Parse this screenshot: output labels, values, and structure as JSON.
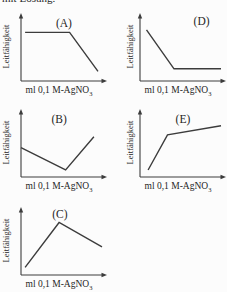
{
  "page": {
    "background": "#fcfcfc",
    "text_color": "#262626",
    "line_color": "#3c3c3c",
    "clipped_top_text": "mit Lösung."
  },
  "axis": {
    "xlabel_main": "ml 0,1 M-AgNO",
    "xlabel_sub": "3",
    "ylabel": "Leitfähigkeit"
  },
  "chart_data": [
    {
      "id": "A",
      "type": "line",
      "title": "(A)",
      "xlabel": "ml 0,1 M-AgNO3",
      "ylabel": "Leitfähigkeit",
      "axis_style": "qualitative axes with arrowheads, no ticks, no numeric scale, no grid",
      "description": "Conductivity stays constant at a high level, then decreases linearly to a low value",
      "points": [
        [
          0.05,
          0.76
        ],
        [
          0.6,
          0.76
        ],
        [
          0.95,
          0.15
        ]
      ],
      "title_x": 0.53,
      "title_y": 16
    },
    {
      "id": "B",
      "type": "line",
      "title": "(B)",
      "xlabel": "ml 0,1 M-AgNO3",
      "ylabel": "Leitfähigkeit",
      "axis_style": "qualitative axes with arrowheads, no ticks, no numeric scale, no grid",
      "description": "Conductivity decreases to a minimum, then rises again above the starting value",
      "points": [
        [
          0.0,
          0.46
        ],
        [
          0.55,
          0.11
        ],
        [
          0.9,
          0.63
        ]
      ],
      "title_x": 0.47,
      "title_y": 16
    },
    {
      "id": "C",
      "type": "line",
      "title": "(C)",
      "xlabel": "ml 0,1 M-AgNO3",
      "ylabel": "Leitfähigkeit",
      "axis_style": "qualitative axes with arrowheads, no ticks, no numeric scale, no grid",
      "description": "Conductivity rises to a maximum, then decreases moderately",
      "points": [
        [
          0.05,
          0.12
        ],
        [
          0.47,
          0.82
        ],
        [
          1.0,
          0.44
        ]
      ],
      "title_x": 0.48,
      "title_y": 13
    },
    {
      "id": "D",
      "type": "line",
      "title": "(D)",
      "xlabel": "ml 0,1 M-AgNO3",
      "ylabel": "Leitfähigkeit",
      "axis_style": "qualitative axes with arrowheads, no ticks, no numeric scale, no grid",
      "description": "Conductivity decreases steeply, then stays constant at a low level",
      "points": [
        [
          0.08,
          0.8
        ],
        [
          0.42,
          0.19
        ],
        [
          1.0,
          0.19
        ]
      ],
      "title_x": 0.76,
      "title_y": 14
    },
    {
      "id": "E",
      "type": "line",
      "title": "(E)",
      "xlabel": "ml 0,1 M-AgNO3",
      "ylabel": "Leitfähigkeit",
      "axis_style": "qualitative axes with arrowheads, no ticks, no numeric scale, no grid",
      "description": "Conductivity rises steeply, then continues to rise slowly",
      "points": [
        [
          0.1,
          0.11
        ],
        [
          0.34,
          0.66
        ],
        [
          1.0,
          0.8
        ]
      ],
      "title_x": 0.53,
      "title_y": 16
    }
  ]
}
